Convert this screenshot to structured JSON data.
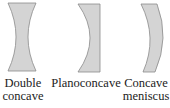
{
  "figure": {
    "lenses": [
      {
        "id": "double-concave",
        "label_line1": "Double",
        "label_line2": "concave"
      },
      {
        "id": "planoconcave",
        "label_line1": "Planoconcave",
        "label_line2": ""
      },
      {
        "id": "concave-meniscus",
        "label_line1": "Concave",
        "label_line2": "meniscus"
      }
    ],
    "colors": {
      "fill": "#d4d4d4",
      "stroke": "#8a8a8a"
    }
  }
}
